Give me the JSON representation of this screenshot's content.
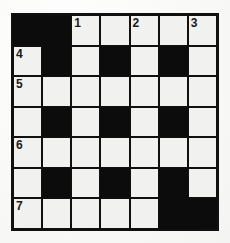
{
  "puzzle": {
    "type": "crossword-grid",
    "rows": 7,
    "cols": 7,
    "colors": {
      "block": "#0d0c0c",
      "cell": "#f1f1ef",
      "grid_line": "#111010",
      "page_background": "#fbfbfa",
      "number_text": "#1a1a1a"
    },
    "cells": [
      [
        {
          "state": "block",
          "number": ""
        },
        {
          "state": "block",
          "number": ""
        },
        {
          "state": "open",
          "number": "1"
        },
        {
          "state": "open",
          "number": ""
        },
        {
          "state": "open",
          "number": "2"
        },
        {
          "state": "open",
          "number": ""
        },
        {
          "state": "open",
          "number": "3"
        }
      ],
      [
        {
          "state": "open",
          "number": "4"
        },
        {
          "state": "block",
          "number": ""
        },
        {
          "state": "open",
          "number": ""
        },
        {
          "state": "block",
          "number": ""
        },
        {
          "state": "open",
          "number": ""
        },
        {
          "state": "block",
          "number": ""
        },
        {
          "state": "open",
          "number": ""
        }
      ],
      [
        {
          "state": "open",
          "number": "5"
        },
        {
          "state": "open",
          "number": ""
        },
        {
          "state": "open",
          "number": ""
        },
        {
          "state": "open",
          "number": ""
        },
        {
          "state": "open",
          "number": ""
        },
        {
          "state": "open",
          "number": ""
        },
        {
          "state": "open",
          "number": ""
        }
      ],
      [
        {
          "state": "open",
          "number": ""
        },
        {
          "state": "block",
          "number": ""
        },
        {
          "state": "open",
          "number": ""
        },
        {
          "state": "block",
          "number": ""
        },
        {
          "state": "open",
          "number": ""
        },
        {
          "state": "block",
          "number": ""
        },
        {
          "state": "open",
          "number": ""
        }
      ],
      [
        {
          "state": "open",
          "number": "6"
        },
        {
          "state": "open",
          "number": ""
        },
        {
          "state": "open",
          "number": ""
        },
        {
          "state": "open",
          "number": ""
        },
        {
          "state": "open",
          "number": ""
        },
        {
          "state": "open",
          "number": ""
        },
        {
          "state": "open",
          "number": ""
        }
      ],
      [
        {
          "state": "open",
          "number": ""
        },
        {
          "state": "block",
          "number": ""
        },
        {
          "state": "open",
          "number": ""
        },
        {
          "state": "block",
          "number": ""
        },
        {
          "state": "open",
          "number": ""
        },
        {
          "state": "block",
          "number": ""
        },
        {
          "state": "open",
          "number": ""
        }
      ],
      [
        {
          "state": "open",
          "number": "7"
        },
        {
          "state": "open",
          "number": ""
        },
        {
          "state": "open",
          "number": ""
        },
        {
          "state": "open",
          "number": ""
        },
        {
          "state": "open",
          "number": ""
        },
        {
          "state": "block",
          "number": ""
        },
        {
          "state": "block",
          "number": ""
        }
      ]
    ]
  }
}
